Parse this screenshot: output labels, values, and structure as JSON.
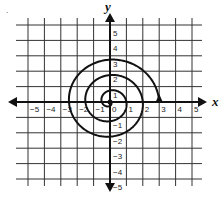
{
  "figure": {
    "type": "coordinate-plane-spiral",
    "x_axis_label": "x",
    "y_axis_label": "y",
    "x_ticks": [
      "-5",
      "-4",
      "-3",
      "-2",
      "-1",
      "0",
      "1",
      "2",
      "3",
      "4",
      "5"
    ],
    "y_ticks": [
      "5",
      "4",
      "3",
      "2",
      "1",
      "-1",
      "-2",
      "-3",
      "-4",
      "-5"
    ],
    "x_range": [
      -5,
      5
    ],
    "y_range": [
      -5,
      5
    ],
    "grid": true,
    "stray_mark": "."
  },
  "spiral": {
    "start": [
      0,
      0
    ],
    "end": [
      3,
      0
    ],
    "end_arrow_direction": "up",
    "turns": 3,
    "description": "Spiral starting at origin, winding outward counterclockwise-looking, ending at (3,0) with arrow"
  },
  "colors": {
    "line": "#111111",
    "grid": "#333333",
    "background": "#ffffff"
  }
}
